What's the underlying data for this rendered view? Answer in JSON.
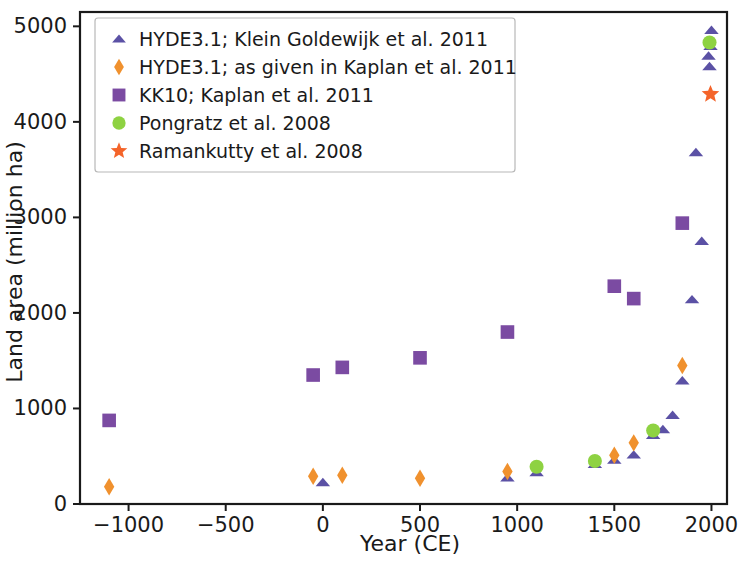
{
  "chart_data": {
    "type": "scatter",
    "title": "",
    "xlabel": "Year (CE)",
    "ylabel": "Land area (million ha)",
    "xlim": [
      -1250,
      2080
    ],
    "ylim": [
      0,
      5150
    ],
    "xticks": [
      -1000,
      -500,
      0,
      500,
      1000,
      1500,
      2000
    ],
    "xticklabels": [
      "−1000",
      "−500",
      "0",
      "500",
      "1000",
      "1500",
      "2000"
    ],
    "yticks": [
      0,
      1000,
      2000,
      3000,
      4000,
      5000
    ],
    "yticklabels": [
      "0",
      "1000",
      "2000",
      "3000",
      "4000",
      "5000"
    ],
    "grid": false,
    "legend_position": "upper left",
    "series": [
      {
        "name": "HYDE3.1; Klein Goldewijk et al. 2011",
        "marker": "triangle",
        "color": "#5b51a5",
        "points": [
          {
            "x": 0,
            "y": 225
          },
          {
            "x": 950,
            "y": 275
          },
          {
            "x": 1100,
            "y": 330
          },
          {
            "x": 1400,
            "y": 415
          },
          {
            "x": 1500,
            "y": 460
          },
          {
            "x": 1600,
            "y": 515
          },
          {
            "x": 1700,
            "y": 720
          },
          {
            "x": 1750,
            "y": 780
          },
          {
            "x": 1800,
            "y": 930
          },
          {
            "x": 1850,
            "y": 1290
          },
          {
            "x": 1900,
            "y": 2140
          },
          {
            "x": 1950,
            "y": 2750
          },
          {
            "x": 1920,
            "y": 3680
          },
          {
            "x": 1990,
            "y": 4580
          },
          {
            "x": 1985,
            "y": 4690
          },
          {
            "x": 2000,
            "y": 4960
          },
          {
            "x": 1995,
            "y": 4790
          }
        ]
      },
      {
        "name": "HYDE3.1; as given in Kaplan et al. 2011",
        "marker": "diamond",
        "color": "#f0912e",
        "points": [
          {
            "x": -1100,
            "y": 180
          },
          {
            "x": -50,
            "y": 290
          },
          {
            "x": 100,
            "y": 300
          },
          {
            "x": 500,
            "y": 270
          },
          {
            "x": 950,
            "y": 340
          },
          {
            "x": 1500,
            "y": 510
          },
          {
            "x": 1600,
            "y": 640
          },
          {
            "x": 1850,
            "y": 1450
          }
        ]
      },
      {
        "name": "KK10; Kaplan et al. 2011",
        "marker": "square",
        "color": "#7b4ba2",
        "points": [
          {
            "x": -1100,
            "y": 875
          },
          {
            "x": -50,
            "y": 1350
          },
          {
            "x": 100,
            "y": 1430
          },
          {
            "x": 500,
            "y": 1530
          },
          {
            "x": 950,
            "y": 1800
          },
          {
            "x": 1500,
            "y": 2280
          },
          {
            "x": 1600,
            "y": 2150
          },
          {
            "x": 1850,
            "y": 2940
          }
        ]
      },
      {
        "name": "Pongratz et al. 2008",
        "marker": "circle",
        "color": "#8ed242",
        "points": [
          {
            "x": 1100,
            "y": 390
          },
          {
            "x": 1400,
            "y": 450
          },
          {
            "x": 1700,
            "y": 770
          },
          {
            "x": 1990,
            "y": 4830
          }
        ]
      },
      {
        "name": "Ramankutty et al. 2008",
        "marker": "star",
        "color": "#f4642a",
        "points": [
          {
            "x": 1995,
            "y": 4290
          }
        ]
      }
    ]
  }
}
